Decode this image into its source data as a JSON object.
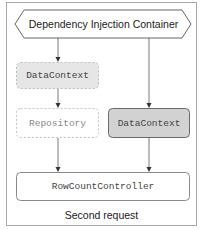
{
  "diagram": {
    "container": {
      "label": "Dependency Injection Container"
    },
    "nodes": {
      "datacontext_transient": {
        "label": "DataContext",
        "style": "dashed-gray-fill"
      },
      "repository": {
        "label": "Repository",
        "style": "dashed-white"
      },
      "datacontext_scoped": {
        "label": "DataContext",
        "style": "solid-gray-fill"
      },
      "controller": {
        "label": "RowCountController",
        "style": "solid-white"
      }
    },
    "edges": [
      {
        "from": "container",
        "to": "datacontext_transient"
      },
      {
        "from": "datacontext_transient",
        "to": "repository"
      },
      {
        "from": "repository",
        "to": "controller"
      },
      {
        "from": "container",
        "to": "datacontext_scoped"
      },
      {
        "from": "datacontext_scoped",
        "to": "controller"
      }
    ],
    "caption": "Second request",
    "colors": {
      "frame_border": "#a8a8a8",
      "dashed_fill": "#e6e6e6",
      "solid_fill": "#d2d2d2",
      "stroke": "#555555"
    }
  }
}
